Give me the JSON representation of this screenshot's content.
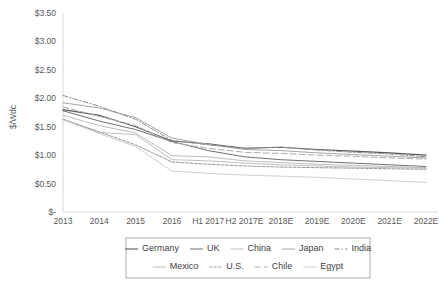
{
  "chart_data": {
    "type": "line",
    "title": "",
    "xlabel": "",
    "ylabel": "$/Wdc",
    "ylim": [
      0,
      3.5
    ],
    "ytick_values": [
      0,
      0.5,
      1.0,
      1.5,
      2.0,
      2.5,
      3.0,
      3.5
    ],
    "ytick_labels": [
      "$-",
      "$0.50",
      "$1.00",
      "$1.50",
      "$2.00",
      "$2.50",
      "$3.00",
      "$3.50"
    ],
    "grid": false,
    "legend_position": "bottom",
    "categories": [
      "2013",
      "2014",
      "2015",
      "2016",
      "H1 2017",
      "H2 2017E",
      "2018E",
      "2019E",
      "2020E",
      "2021E",
      "2022E"
    ],
    "series": [
      {
        "name": "Germany",
        "color": "#595959",
        "dash": "none",
        "width": 1.1,
        "values": [
          1.8,
          1.7,
          1.5,
          1.25,
          1.2,
          1.12,
          1.14,
          1.1,
          1.07,
          1.04,
          1.0
        ]
      },
      {
        "name": "UK",
        "color": "#6f6f6f",
        "dash": "none",
        "width": 1.0,
        "values": [
          1.78,
          1.6,
          1.45,
          1.24,
          1.08,
          0.97,
          0.92,
          0.89,
          0.86,
          0.83,
          0.8
        ]
      },
      {
        "name": "China",
        "color": "#bfbfbf",
        "dash": "none",
        "width": 1.0,
        "values": [
          1.63,
          1.4,
          1.36,
          0.92,
          0.9,
          0.86,
          0.83,
          0.81,
          0.79,
          0.78,
          0.77
        ]
      },
      {
        "name": "Japan",
        "color": "#a6a6a6",
        "dash": "none",
        "width": 1.0,
        "values": [
          1.92,
          1.83,
          1.66,
          1.3,
          1.19,
          1.1,
          1.08,
          1.04,
          1.01,
          0.98,
          0.95
        ]
      },
      {
        "name": "India",
        "color": "#8c8c8c",
        "dash": "5,2,1.5,2",
        "width": 1.0,
        "values": [
          2.05,
          1.86,
          1.63,
          1.26,
          1.18,
          1.12,
          1.14,
          1.09,
          1.05,
          1.02,
          0.97
        ]
      },
      {
        "name": "Mexico",
        "color": "#bdbdbd",
        "dash": "none",
        "width": 1.0,
        "values": [
          1.7,
          1.52,
          1.39,
          0.99,
          0.97,
          0.9,
          0.87,
          0.84,
          0.82,
          0.8,
          0.78
        ]
      },
      {
        "name": "U.S.",
        "color": "#9a9a9a",
        "dash": "3,1.5",
        "width": 1.0,
        "values": [
          1.63,
          1.41,
          1.18,
          0.88,
          0.84,
          0.81,
          0.79,
          0.78,
          0.77,
          0.76,
          0.75
        ]
      },
      {
        "name": "Chile",
        "color": "#adadad",
        "dash": "6,3",
        "width": 1.0,
        "values": [
          1.85,
          1.68,
          1.52,
          1.22,
          1.12,
          1.05,
          1.03,
          1.0,
          0.98,
          0.95,
          0.93
        ]
      },
      {
        "name": "Egypt",
        "color": "#cfcfcf",
        "dash": "none",
        "width": 1.0,
        "values": [
          1.62,
          1.38,
          1.15,
          0.72,
          0.68,
          0.65,
          0.63,
          0.61,
          0.58,
          0.55,
          0.52
        ]
      }
    ]
  },
  "axis": {
    "y_title": "$/Wdc"
  },
  "legend": {
    "rows": [
      [
        "Germany",
        "UK",
        "China",
        "Japan",
        "India"
      ],
      [
        "Mexico",
        "U.S.",
        "Chile",
        "Egypt"
      ]
    ]
  }
}
